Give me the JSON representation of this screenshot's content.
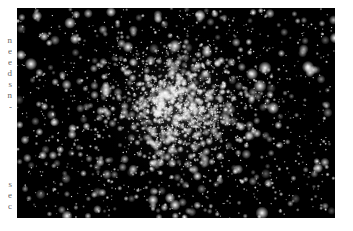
{
  "page": {
    "margin_fragments": [
      {
        "text": "n"
      },
      {
        "text": "e"
      },
      {
        "text": "e"
      },
      {
        "text": "d"
      },
      {
        "text": "s"
      },
      {
        "text": "n"
      },
      {
        "text": "-"
      },
      {
        "text": "s"
      },
      {
        "text": "e"
      },
      {
        "text": "c"
      }
    ]
  },
  "figure": {
    "subject": "globular star cluster",
    "description": "Astronomical photograph of a dense globular star cluster against a black sky",
    "colors": {
      "sky": "#000000",
      "star": "#ffffff"
    }
  }
}
